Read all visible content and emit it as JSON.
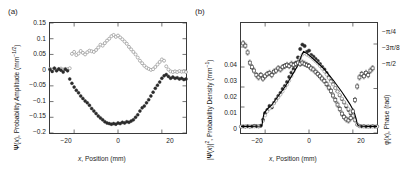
{
  "figure": {
    "panels": [
      {
        "label": "(a)",
        "xlabel": "x, Position (mm)",
        "ylabel_left": "Ψ(x), Probability Amplitude (mm",
        "ylabel_left_sup": "−1/2",
        "ylabel_left_tail": ")",
        "xticks": [
          "−20",
          "0",
          "20"
        ],
        "yticks": [
          "0.15",
          "0.1",
          "0.05",
          "0",
          "−0.05",
          "−0.1",
          "−0.15",
          "−0.2"
        ]
      },
      {
        "label": "(b)",
        "xlabel": "x, Position (mm)",
        "ylabel_left": "|Ψ(x)|², Probability Density (mm",
        "ylabel_left_sup": "−1",
        "ylabel_left_tail": ")",
        "ylabel_right": "φ(x), Phase (rad)",
        "xticks": [
          "−20",
          "0",
          "20"
        ],
        "yticks_left": [
          "0.04",
          "0.03",
          "0.02",
          "0.01",
          "0"
        ],
        "yticks_right": [
          "−π/4",
          "−3π/8",
          "−π/2"
        ]
      }
    ]
  },
  "chart_data": [
    {
      "type": "scatter",
      "panel": "(a)",
      "title": "",
      "xlabel": "x, Position (mm)",
      "ylabel": "Ψ(x), Probability Amplitude (mm^-1/2)",
      "xlim": [
        -31,
        31
      ],
      "ylim": [
        -0.2,
        0.15
      ],
      "xticks": [
        -20,
        0,
        20
      ],
      "yticks": [
        0.15,
        0.1,
        0.05,
        0,
        -0.05,
        -0.1,
        -0.15,
        -0.2
      ],
      "grid": false,
      "legend": null,
      "series": [
        {
          "name": "Imaginary part of probability amplitude",
          "marker": "open-circle",
          "color": "#9a9a9a",
          "x": [
            -31,
            -30,
            -29,
            -28,
            -27,
            -26,
            -25,
            -24,
            -23,
            -22,
            -21,
            -20,
            -19,
            -18,
            -17,
            -16,
            -15,
            -14,
            -13,
            -12,
            -11,
            -10,
            -9,
            -8,
            -7,
            -6,
            -5,
            -4,
            -3,
            -2,
            -1,
            0,
            1,
            2,
            3,
            4,
            5,
            6,
            7,
            8,
            9,
            10,
            11,
            12,
            13,
            14,
            15,
            16,
            17,
            18,
            19,
            20,
            21,
            22,
            23,
            24,
            25,
            26,
            27,
            28,
            29,
            30,
            31
          ],
          "y": [
            0.004,
            0.002,
            0.006,
            0.001,
            0.003,
            0.005,
            0.002,
            0.004,
            0.003,
            0.006,
            0.052,
            0.058,
            0.048,
            0.053,
            0.061,
            0.055,
            0.05,
            0.057,
            0.062,
            0.06,
            0.058,
            0.064,
            0.072,
            0.081,
            0.078,
            0.086,
            0.094,
            0.1,
            0.108,
            0.112,
            0.106,
            0.11,
            0.104,
            0.098,
            0.091,
            0.084,
            0.074,
            0.066,
            0.058,
            0.05,
            0.04,
            0.03,
            0.022,
            0.014,
            0.008,
            0.004,
            0.001,
            0.003,
            0.01,
            0.018,
            0.026,
            0.034,
            0.03,
            0.012,
            0.002,
            -0.004,
            -0.006,
            -0.004,
            -0.006,
            -0.003,
            -0.005,
            -0.004,
            -0.006
          ]
        },
        {
          "name": "Real part of probability amplitude",
          "marker": "filled-circle",
          "color": "#2b2b2b",
          "x": [
            -31,
            -30,
            -29,
            -28,
            -27,
            -26,
            -25,
            -24,
            -23,
            -22,
            -21,
            -20,
            -19,
            -18,
            -17,
            -16,
            -15,
            -14,
            -13,
            -12,
            -11,
            -10,
            -9,
            -8,
            -7,
            -6,
            -5,
            -4,
            -3,
            -2,
            -1,
            0,
            1,
            2,
            3,
            4,
            5,
            6,
            7,
            8,
            9,
            10,
            11,
            12,
            13,
            14,
            15,
            16,
            17,
            18,
            19,
            20,
            21,
            22,
            23,
            24,
            25,
            26,
            27,
            28,
            29,
            30,
            31
          ],
          "y": [
            0.002,
            -0.004,
            0.006,
            -0.002,
            0.004,
            0.0,
            -0.006,
            0.003,
            -0.002,
            -0.028,
            -0.042,
            -0.054,
            -0.064,
            -0.072,
            -0.082,
            -0.09,
            -0.098,
            -0.104,
            -0.112,
            -0.122,
            -0.13,
            -0.138,
            -0.146,
            -0.152,
            -0.158,
            -0.164,
            -0.168,
            -0.17,
            -0.172,
            -0.17,
            -0.172,
            -0.168,
            -0.17,
            -0.166,
            -0.168,
            -0.164,
            -0.166,
            -0.162,
            -0.158,
            -0.15,
            -0.142,
            -0.13,
            -0.12,
            -0.114,
            -0.104,
            -0.094,
            -0.082,
            -0.07,
            -0.058,
            -0.048,
            -0.038,
            -0.026,
            -0.018,
            -0.014,
            -0.02,
            -0.026,
            -0.022,
            -0.026,
            -0.024,
            -0.028,
            -0.026,
            -0.03,
            -0.028
          ]
        }
      ]
    },
    {
      "type": "scatter",
      "panel": "(b)",
      "title": "",
      "xlabel": "x, Position (mm)",
      "ylabel_left": "|Ψ(x)|², Probability Density (mm^-1)",
      "ylabel_right": "φ(x), Phase (rad)",
      "xlim": [
        -31,
        31
      ],
      "ylim_left": [
        -0.003,
        0.052
      ],
      "ylim_right": [
        -1.5707963,
        -0.6
      ],
      "xticks": [
        -20,
        0,
        20
      ],
      "yticks_left": [
        0,
        0.01,
        0.02,
        0.03,
        0.04
      ],
      "yticks_right_labels": [
        "−π/4",
        "−3π/8",
        "−π/2"
      ],
      "yticks_right_values": [
        -0.7853982,
        -1.1780972,
        -1.5707963
      ],
      "grid": false,
      "legend": null,
      "series": [
        {
          "name": "Measured probability density",
          "axis": "left",
          "marker": "filled-circle",
          "color": "#2b2b2b",
          "x": [
            -31,
            -30,
            -29,
            -28,
            -27,
            -26,
            -25,
            -24,
            -23,
            -22,
            -21,
            -20,
            -19,
            -18,
            -17,
            -16,
            -15,
            -14,
            -13,
            -12,
            -11,
            -10,
            -9,
            -8,
            -7,
            -6,
            -5,
            -4,
            -3,
            -2,
            -1,
            0,
            1,
            2,
            3,
            4,
            5,
            6,
            7,
            8,
            9,
            10,
            11,
            12,
            13,
            14,
            15,
            16,
            17,
            18,
            19,
            20,
            21,
            22,
            23,
            24,
            25,
            26,
            27,
            28,
            29,
            30,
            31
          ],
          "y": [
            0.0002,
            0.0003,
            0.0002,
            0.0004,
            0.0002,
            0.0003,
            0.0005,
            0.0004,
            0.0003,
            0.0006,
            0.0035,
            0.007,
            0.0085,
            0.0105,
            0.0098,
            0.012,
            0.0138,
            0.0155,
            0.017,
            0.019,
            0.0205,
            0.0225,
            0.025,
            0.0272,
            0.029,
            0.032,
            0.0348,
            0.039,
            0.0412,
            0.0405,
            0.0375,
            0.0382,
            0.036,
            0.0352,
            0.034,
            0.033,
            0.0315,
            0.03,
            0.0288,
            0.027,
            0.025,
            0.0232,
            0.0215,
            0.0195,
            0.0178,
            0.0158,
            0.014,
            0.0122,
            0.0102,
            0.0085,
            0.0068,
            0.005,
            0.0032,
            0.0012,
            0.0005,
            0.0003,
            0.0004,
            0.0002,
            0.0003,
            0.0002,
            0.0004,
            0.0002,
            0.0003
          ]
        },
        {
          "name": "Reconstructed probability density",
          "axis": "left",
          "marker": "open-circle",
          "color": "#a0a0a0",
          "x": [
            -31,
            -29,
            -27,
            -25,
            -23,
            -21,
            -20,
            -19,
            -18,
            -17,
            -16,
            -15,
            -14,
            -13,
            -12,
            -11,
            -10,
            -9,
            -8,
            -7,
            -6,
            -5,
            -4,
            -3,
            -2,
            -1,
            0,
            1,
            2,
            3,
            4,
            5,
            6,
            7,
            8,
            9,
            10,
            11,
            12,
            13,
            14,
            15,
            16,
            17,
            18,
            19,
            20,
            21,
            22,
            23,
            25,
            27,
            29,
            31
          ],
          "y": [
            0.0002,
            0.0003,
            0.0002,
            0.0003,
            0.0004,
            0.003,
            0.0058,
            0.0078,
            0.0092,
            0.0104,
            0.0118,
            0.0132,
            0.0148,
            0.0162,
            0.0178,
            0.0195,
            0.0212,
            0.0232,
            0.0255,
            0.0278,
            0.03,
            0.0325,
            0.0345,
            0.0362,
            0.037,
            0.0362,
            0.0356,
            0.0348,
            0.0338,
            0.0328,
            0.0318,
            0.0305,
            0.0292,
            0.0278,
            0.0262,
            0.0245,
            0.0228,
            0.0212,
            0.0195,
            0.0178,
            0.016,
            0.0142,
            0.0125,
            0.0108,
            0.009,
            0.0072,
            0.0055,
            0.0035,
            0.0012,
            0.0004,
            0.0003,
            0.0002,
            0.0003,
            0.0002
          ]
        },
        {
          "name": "Theory curve",
          "axis": "left",
          "marker": "line",
          "color": "#000000",
          "x": [
            -31,
            -27,
            -24,
            -22,
            -21.4,
            -21,
            -20.5,
            -19,
            -17,
            -15,
            -13,
            -11,
            -9,
            -7,
            -5,
            -3.5,
            -2.5,
            -1,
            1,
            3,
            5,
            7,
            9,
            11,
            13,
            15,
            17,
            19,
            20.5,
            21.5,
            22,
            22.5,
            24,
            27,
            31
          ],
          "y": [
            0.0003,
            0.0003,
            0.0004,
            0.0005,
            0.001,
            0.0042,
            0.0068,
            0.009,
            0.011,
            0.014,
            0.017,
            0.02,
            0.0235,
            0.0272,
            0.031,
            0.0355,
            0.0378,
            0.0368,
            0.035,
            0.033,
            0.031,
            0.0288,
            0.0262,
            0.0235,
            0.0205,
            0.0175,
            0.0142,
            0.0108,
            0.0078,
            0.004,
            0.0015,
            0.0006,
            0.0004,
            0.0003,
            0.0003
          ]
        },
        {
          "name": "Measured phase",
          "axis": "right",
          "marker": "open-square",
          "color": "#3a3a3a",
          "errorbars": true,
          "x": [
            -30,
            -29,
            -28,
            -27,
            -26,
            -25,
            -24,
            -23,
            -22,
            -21,
            -20,
            -19,
            -18,
            -17,
            -16,
            -15,
            -14,
            -13,
            -12,
            -11,
            -10,
            -9,
            -8,
            -7,
            -6,
            -5,
            -4,
            -3,
            -2,
            -1,
            0,
            1,
            2,
            3,
            4,
            5,
            6,
            7,
            8,
            9,
            10,
            11,
            12,
            13,
            14,
            15,
            16,
            17,
            18,
            19,
            20,
            21,
            22,
            23,
            24,
            25,
            26,
            27,
            28,
            29
          ],
          "y": [
            -0.78,
            -0.8,
            -0.86,
            -0.95,
            -0.99,
            -1.02,
            -1.06,
            -1.08,
            -1.06,
            -1.09,
            -1.07,
            -1.05,
            -1.04,
            -1.06,
            -1.03,
            -1.02,
            -1.0,
            -1.01,
            -0.99,
            -0.98,
            -0.97,
            -0.98,
            -0.96,
            -0.97,
            -0.96,
            -0.95,
            -0.96,
            -0.95,
            -0.96,
            -0.97,
            -0.98,
            -1.0,
            -1.01,
            -1.03,
            -1.05,
            -1.07,
            -1.09,
            -1.11,
            -1.14,
            -1.17,
            -1.2,
            -1.24,
            -1.28,
            -1.32,
            -1.36,
            -1.4,
            -1.43,
            -1.45,
            -1.46,
            -1.44,
            -1.38,
            -1.28,
            -1.16,
            -1.08,
            -1.05,
            -1.07,
            -1.04,
            -1.06,
            -1.02,
            -1.0
          ]
        }
      ]
    }
  ]
}
